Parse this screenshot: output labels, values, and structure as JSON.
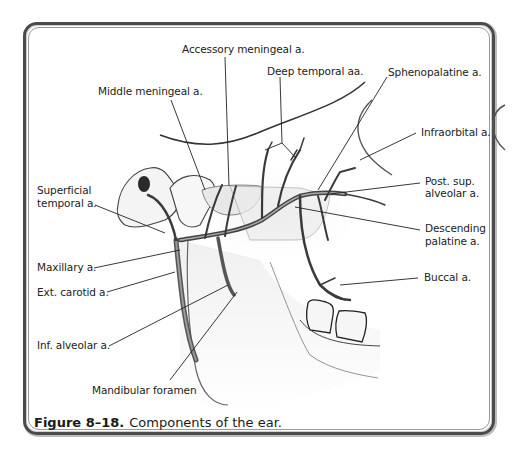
{
  "figure": {
    "number": "Figure 8–18.",
    "caption": "Components of the ear."
  },
  "labels": {
    "accessory_meningeal": "Accessory meningeal a.",
    "deep_temporal": "Deep temporal aa.",
    "sphenopalatine": "Sphenopalatine a.",
    "middle_meningeal": "Middle meningeal a.",
    "infraorbital": "Infraorbital a.",
    "superficial_temporal_1": "Superficial",
    "superficial_temporal_2": "temporal a.",
    "post_sup_alveolar_1": "Post. sup.",
    "post_sup_alveolar_2": "alveolar a.",
    "descending_palatine_1": "Descending",
    "descending_palatine_2": "palatine a.",
    "maxillary": "Maxillary a.",
    "ext_carotid": "Ext. carotid a.",
    "buccal": "Buccal a.",
    "inf_alveolar": "Inf. alveolar a.",
    "mandibular_foramen": "Mandibular foramen"
  },
  "colors": {
    "frame": "#4a4a4a",
    "vessel": "#3a3a3a",
    "bone_outline": "#2a2a2a",
    "leader_line": "#222222"
  }
}
